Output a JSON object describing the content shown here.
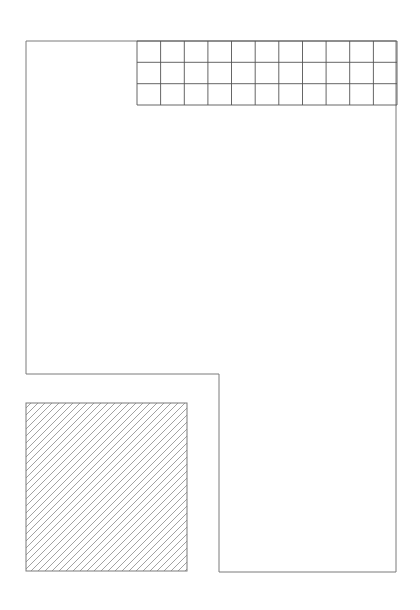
{
  "diagram": {
    "background": "#ffffff",
    "stroke_color": "#7a7a7a",
    "grid_stroke_color": "#555555",
    "hatch_color": "#8a8a8a",
    "outline": {
      "shape": "l-shaped-polygon",
      "points": [
        [
          26,
          41
        ],
        [
          396,
          41
        ],
        [
          396,
          572
        ],
        [
          219,
          572
        ],
        [
          219,
          374
        ],
        [
          26,
          374
        ]
      ]
    },
    "grid": {
      "x": 137,
      "y": 41,
      "width": 260,
      "height": 64,
      "columns": 11,
      "rows": 3
    },
    "hatched_square": {
      "x": 26,
      "y": 403,
      "width": 161,
      "height": 168,
      "hatch_angle_deg": 45,
      "hatch_spacing": 7
    }
  }
}
